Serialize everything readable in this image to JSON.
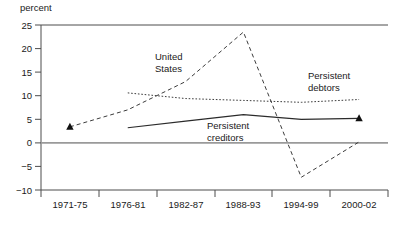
{
  "chart_data": {
    "type": "line",
    "title": "",
    "subtitle": "",
    "xlabel": "",
    "ylabel": "percent",
    "categories": [
      "1971-75",
      "1976-81",
      "1982-87",
      "1988-93",
      "1994-99",
      "2000-02"
    ],
    "ylim": [
      -10,
      25
    ],
    "xlim": [
      0,
      5
    ],
    "yticks": [
      25,
      20,
      15,
      10,
      5,
      0,
      -5,
      -10
    ],
    "ytick_labels": [
      "25",
      "20",
      "15",
      "10",
      "5",
      "0",
      "−5",
      "−10"
    ],
    "grid": false,
    "legend": "inline-annotations",
    "zero_line": true,
    "series": [
      {
        "name": "United States",
        "style": "dashed",
        "color": "#3c3c3c",
        "x": [
          "1971-75",
          "1976-81",
          "1982-87",
          "1988-93",
          "1994-99",
          "2000-02"
        ],
        "values": [
          3.4,
          7.0,
          13.0,
          23.5,
          -7.3,
          0.2
        ],
        "marker_points": [
          {
            "category": "1971-75",
            "value": 3.4,
            "marker": "triangle"
          },
          {
            "category": "2000-02",
            "value": 5.2,
            "marker": "triangle"
          }
        ]
      },
      {
        "name": "Persistent debtors",
        "style": "dotted",
        "color": "#3c3c3c",
        "x": [
          "1976-81",
          "1982-87",
          "1988-93",
          "1994-99",
          "2000-02"
        ],
        "values": [
          10.6,
          9.4,
          9.0,
          8.6,
          9.2
        ]
      },
      {
        "name": "Persistent creditors",
        "style": "solid",
        "color": "#2b2b2b",
        "x": [
          "1976-81",
          "1982-87",
          "1988-93",
          "1994-99",
          "2000-02"
        ],
        "values": [
          3.2,
          4.6,
          6.0,
          5.0,
          5.2
        ]
      }
    ],
    "annotations": [
      {
        "name": "united-states-label",
        "text_line1": "United",
        "text_line2": "States",
        "x_px": 155,
        "y_px": 60
      },
      {
        "name": "persistent-debtors-label",
        "text_line1": "Persistent",
        "text_line2": "debtors",
        "x_px": 308,
        "y_px": 79
      },
      {
        "name": "persistent-creditors-label",
        "text_line1": "Persistent",
        "text_line2": "creditors",
        "x_px": 207,
        "y_px": 129
      }
    ]
  },
  "axis": {
    "unit_label": "percent"
  },
  "footnote": {
    "text": ""
  }
}
